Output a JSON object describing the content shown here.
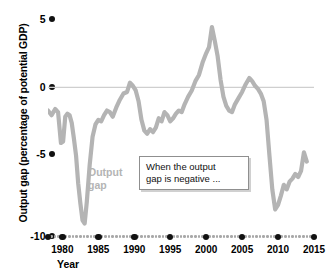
{
  "chart_data": {
    "type": "line",
    "title": "",
    "subtitle": "",
    "xlabel": "Year",
    "ylabel": "Output gap (percentage of potential GDP)",
    "xlim": [
      1978,
      2015
    ],
    "ylim": [
      -10,
      5
    ],
    "xticks": [
      1980,
      1985,
      1990,
      1995,
      2000,
      2005,
      2010,
      2015
    ],
    "xtick_labels": [
      "1980",
      "1985",
      "1990",
      "1995",
      "2000",
      "2005",
      "2010",
      "2015"
    ],
    "yticks": [
      5,
      0,
      -5,
      -10
    ],
    "ytick_labels": [
      "5",
      "0",
      "-5",
      "-10"
    ],
    "grid": false,
    "zero_line": true,
    "legend_position": "inline",
    "series": [
      {
        "name": "Output gap",
        "color": "#b4b4b4",
        "x": [
          1978.0,
          1978.5,
          1979.0,
          1979.4,
          1979.8,
          1980.1,
          1980.4,
          1980.7,
          1981.0,
          1981.3,
          1981.6,
          1981.9,
          1982.2,
          1982.5,
          1982.8,
          1983.1,
          1983.4,
          1983.8,
          1984.2,
          1984.6,
          1985.0,
          1985.4,
          1985.8,
          1986.2,
          1986.6,
          1987.0,
          1987.5,
          1988.0,
          1988.5,
          1989.0,
          1989.4,
          1989.8,
          1990.2,
          1990.6,
          1991.0,
          1991.4,
          1991.8,
          1992.2,
          1992.6,
          1993.0,
          1993.4,
          1993.8,
          1994.2,
          1994.6,
          1995.0,
          1995.4,
          1995.8,
          1996.2,
          1996.6,
          1997.0,
          1997.5,
          1998.0,
          1998.5,
          1999.0,
          1999.5,
          2000.0,
          2000.4,
          2000.8,
          2001.2,
          2001.6,
          2002.0,
          2002.4,
          2002.8,
          2003.2,
          2003.6,
          2004.0,
          2004.5,
          2005.0,
          2005.5,
          2006.0,
          2006.4,
          2006.8,
          2007.2,
          2007.6,
          2008.0,
          2008.4,
          2008.8,
          2009.2,
          2009.6,
          2010.0,
          2010.4,
          2010.8,
          2011.2,
          2011.6,
          2012.0,
          2012.4,
          2012.8,
          2013.2,
          2013.6,
          2014.0
        ],
        "y": [
          -1.5,
          -1.8,
          -1.4,
          -1.6,
          -3.6,
          -3.5,
          -1.9,
          -1.7,
          -1.8,
          -2.3,
          -3.3,
          -4.4,
          -6.2,
          -7.5,
          -8.6,
          -8.8,
          -7.4,
          -5.0,
          -3.2,
          -2.4,
          -2.1,
          -2.2,
          -1.8,
          -1.5,
          -1.6,
          -1.9,
          -1.3,
          -0.8,
          -0.4,
          -0.3,
          0.3,
          0.1,
          -0.2,
          -0.9,
          -2.1,
          -2.8,
          -3.0,
          -2.7,
          -2.9,
          -2.6,
          -2.0,
          -2.2,
          -1.6,
          -1.8,
          -2.2,
          -2.0,
          -1.7,
          -1.5,
          -1.6,
          -1.1,
          -0.6,
          -0.2,
          0.4,
          0.8,
          1.6,
          2.2,
          2.6,
          3.9,
          3.0,
          2.0,
          0.5,
          -0.6,
          -1.2,
          -1.5,
          -1.6,
          -1.1,
          -0.7,
          -0.3,
          0.2,
          0.6,
          0.4,
          0.1,
          -0.1,
          -0.4,
          -0.9,
          -2.1,
          -4.4,
          -6.6,
          -7.9,
          -7.6,
          -7.0,
          -6.3,
          -6.6,
          -6.1,
          -5.9,
          -5.6,
          -5.8,
          -5.4,
          -4.2,
          -4.8
        ]
      }
    ],
    "annotations": [
      {
        "name": "callout",
        "text": "When the output gap is negative ..."
      }
    ]
  },
  "axes": {
    "y_title": "Output gap (percentage of potential GDP)",
    "x_title": "Year",
    "y_tick_labels": [
      "5",
      "0",
      "-5",
      "-10"
    ],
    "x_tick_labels": [
      "1980",
      "1985",
      "1990",
      "1995",
      "2000",
      "2005",
      "2010",
      "2015"
    ]
  },
  "series_label": {
    "line1": "Output",
    "line2": "gap"
  },
  "annotation": {
    "line1": "When the output",
    "line2": "gap is negative ..."
  },
  "colors": {
    "series": "#b4b4b4",
    "zero_line": "#cfcfcf",
    "tick_dot": "#111111",
    "minor_dot": "#a8a8a8",
    "annotation_border": "#8f8f8f"
  }
}
